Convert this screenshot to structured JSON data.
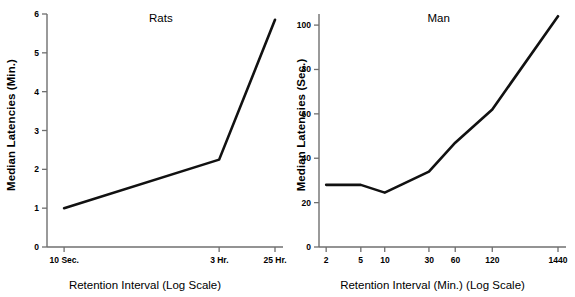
{
  "figure": {
    "background": "#ffffff",
    "line_color": "#111111",
    "axis_color": "#6f6f6f"
  },
  "chart_data": [
    {
      "type": "line",
      "title": "Rats",
      "xlabel": "Retention Interval  (Log Scale)",
      "ylabel": "Median Latencies (Min.)",
      "categories": [
        "10 Sec.",
        "3 Hr.",
        "25 Hr."
      ],
      "x_tick_positions": [
        0.075,
        0.755,
        1.0
      ],
      "values": [
        1.0,
        2.25,
        5.85
      ],
      "ylim": [
        0,
        6
      ],
      "y_ticks": [
        0,
        1,
        2,
        3,
        4,
        5,
        6
      ],
      "y_tick_labels": [
        "0",
        "1",
        "2",
        "3",
        "4",
        "5",
        "6"
      ],
      "grid": false,
      "legend": "none"
    },
    {
      "type": "line",
      "title": "Man",
      "xlabel": "Retention Interval (Min.)  (Log Scale)",
      "ylabel": "Median Latencies (Sec.)",
      "categories": [
        "2",
        "5",
        "10",
        "30",
        "60",
        "120",
        "1440"
      ],
      "x_tick_positions": [
        0.03,
        0.175,
        0.275,
        0.46,
        0.57,
        0.725,
        1.0
      ],
      "values": [
        28,
        28,
        24.5,
        34,
        47,
        62,
        104
      ],
      "ylim": [
        0,
        105
      ],
      "y_ticks": [
        0,
        20,
        40,
        60,
        80,
        100
      ],
      "y_tick_labels": [
        "0",
        "20",
        "40",
        "60",
        "80",
        "100"
      ],
      "grid": false,
      "legend": "none"
    }
  ]
}
